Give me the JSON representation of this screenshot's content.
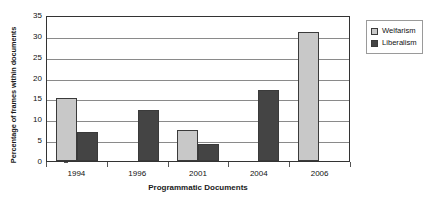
{
  "chart_data": {
    "type": "bar",
    "title": "",
    "subtitle": "",
    "xlabel": "Programmatic Documents",
    "ylabel": "Percentage of frames within documents",
    "categories": [
      "1994",
      "1996",
      "2001",
      "2004",
      "2006"
    ],
    "series": [
      {
        "name": "Welfarism",
        "color": "#c8c8c8",
        "values": [
          15,
          0,
          7.4,
          0,
          31
        ]
      },
      {
        "name": "Liberalism",
        "color": "#444444",
        "values": [
          7,
          12.2,
          4,
          17,
          0
        ]
      }
    ],
    "ylim": [
      0,
      35
    ],
    "ytick_step": 5,
    "yticks": [
      "0",
      "5",
      "10",
      "15",
      "20",
      "25",
      "30",
      "35"
    ],
    "grid": "horizontal",
    "legend_position": "right",
    "legend_entries": [
      "Welfarism",
      "Liberalism"
    ]
  },
  "legend": {
    "items": [
      {
        "label": "Welfarism"
      },
      {
        "label": "Liberalism"
      }
    ]
  },
  "axes": {
    "x_title": "Programmatic Documents",
    "y_title": "Percentage of frames within documents"
  }
}
